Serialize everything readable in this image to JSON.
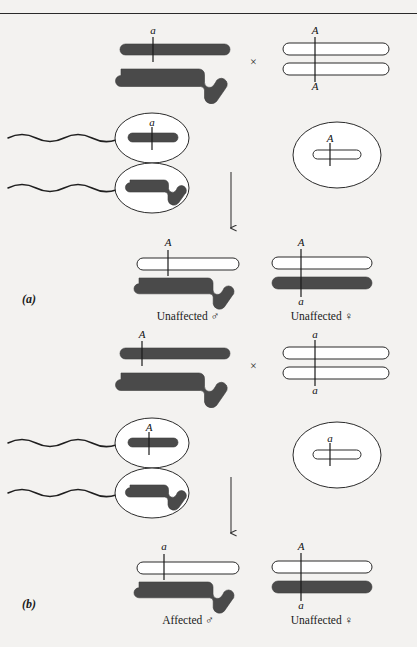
{
  "figure": {
    "panels": [
      {
        "id": "a",
        "label": "(a)",
        "cross_symbol": "×",
        "parents": {
          "father": {
            "x_allele": "a",
            "x_fill": "dark",
            "y_fill": "dark"
          },
          "mother": {
            "x1_allele": "A",
            "x2_allele": "A",
            "x1_fill": "white",
            "x2_fill": "white"
          }
        },
        "gametes": {
          "sperm_x": {
            "allele": "a",
            "fill": "dark"
          },
          "sperm_y": {
            "allele": "",
            "fill": "dark"
          },
          "egg": {
            "allele": "A",
            "fill": "white"
          }
        },
        "offspring": [
          {
            "sex": "male",
            "caption": "Unaffected ♂",
            "top_allele": "A",
            "top_fill": "white",
            "bottom_allele": "",
            "bottom_fill": "dark"
          },
          {
            "sex": "female",
            "caption": "Unaffected ♀",
            "top_allele": "A",
            "top_fill": "white",
            "bottom_allele": "a",
            "bottom_fill": "dark"
          }
        ]
      },
      {
        "id": "b",
        "label": "(b)",
        "cross_symbol": "×",
        "parents": {
          "father": {
            "x_allele": "A",
            "x_fill": "dark",
            "y_fill": "dark"
          },
          "mother": {
            "x1_allele": "a",
            "x2_allele": "a",
            "x1_fill": "white",
            "x2_fill": "white"
          }
        },
        "gametes": {
          "sperm_x": {
            "allele": "A",
            "fill": "dark"
          },
          "sperm_y": {
            "allele": "",
            "fill": "dark"
          },
          "egg": {
            "allele": "a",
            "fill": "white"
          }
        },
        "offspring": [
          {
            "sex": "male",
            "caption": "Affected ♂",
            "top_allele": "a",
            "top_fill": "white",
            "bottom_allele": "",
            "bottom_fill": "dark"
          },
          {
            "sex": "female",
            "caption": "Unaffected ♀",
            "top_allele": "A",
            "top_fill": "white",
            "bottom_allele": "a",
            "bottom_fill": "dark"
          }
        ]
      }
    ],
    "colors": {
      "dark_chromosome": "#4a4a4a",
      "outline": "#2b2b2b",
      "background": "#f3f2f0",
      "text": "#1a1a1a"
    }
  }
}
